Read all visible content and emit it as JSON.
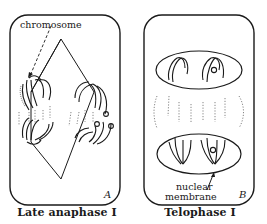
{
  "panels": [
    {
      "id": "A",
      "letter": "A",
      "caption": "Late anaphase I",
      "labels": {
        "chromosome": "chromosome"
      }
    },
    {
      "id": "B",
      "letter": "B",
      "caption": "Telophase I",
      "labels": {
        "nuclear_membrane_line1": "nuclear",
        "nuclear_membrane_line2": "membrane"
      }
    }
  ],
  "colors": {
    "ink": "#1a1a1a",
    "background": "#ffffff"
  }
}
